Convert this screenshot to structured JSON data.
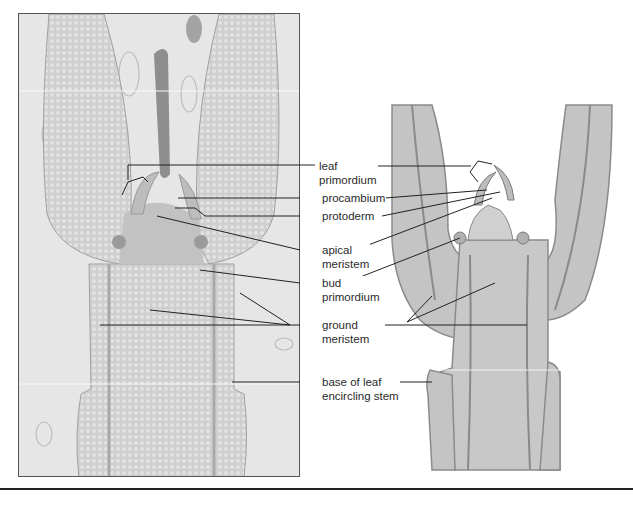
{
  "figure": {
    "left_panel": "micrograph",
    "right_panel": "drawing",
    "labels": [
      {
        "id": "leaf-primordium",
        "line1": "leaf",
        "line2": "primordium"
      },
      {
        "id": "procambium",
        "line1": "procambium",
        "line2": ""
      },
      {
        "id": "protoderm",
        "line1": "protoderm",
        "line2": ""
      },
      {
        "id": "apical-meristem",
        "line1": "apical",
        "line2": "meristem"
      },
      {
        "id": "bud-primordium",
        "line1": "bud",
        "line2": "primordium"
      },
      {
        "id": "ground-meristem",
        "line1": "ground",
        "line2": "meristem"
      },
      {
        "id": "base-of-leaf",
        "line1": "base of leaf",
        "line2": "encircling stem"
      }
    ]
  }
}
